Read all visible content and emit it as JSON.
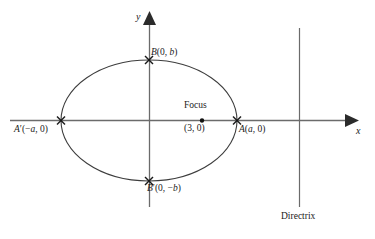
{
  "figure": {
    "background_color": "#ffffff",
    "line_color": "#6b6b6b",
    "text_color": "#1a1a1a",
    "axes": {
      "x_axis_label": "x",
      "y_axis_label": "y",
      "origin_label": ""
    },
    "labels": {
      "vertex_b": "B(0, b)",
      "vertex_b_prime": "B′(0, −b)",
      "vertex_a": "A(a, 0)",
      "vertex_a_prime": "A′(−a, 0)",
      "focus_title": "Focus",
      "focus_coordinates": "(3, 0)",
      "directrix": "Directrix"
    }
  },
  "chart_data": {
    "type": "scatter",
    "xlabel": "x",
    "ylabel": "y",
    "grid": false,
    "legend": null,
    "curves": [
      {
        "name": "ellipse",
        "shape": "ellipse",
        "center": [
          0,
          0
        ],
        "semi_major_axis_label": "a",
        "semi_minor_axis_label": "b",
        "center_px": [
          149,
          120
        ],
        "radius_x_px": 88,
        "radius_y_px": 60
      },
      {
        "name": "directrix",
        "shape": "vertical-line",
        "x_px": 299,
        "y_start_px": 28,
        "y_end_px": 207
      }
    ],
    "points": [
      {
        "name": "A",
        "label": "A(a, 0)",
        "marker": "x",
        "coords": [
          "a",
          0
        ],
        "px": [
          237,
          120
        ]
      },
      {
        "name": "A'",
        "label": "A′(−a, 0)",
        "marker": "x",
        "coords": [
          "-a",
          0
        ],
        "px": [
          61,
          120
        ]
      },
      {
        "name": "B",
        "label": "B(0, b)",
        "marker": "x",
        "coords": [
          0,
          "b"
        ],
        "px": [
          149,
          60
        ]
      },
      {
        "name": "B'",
        "label": "B′(0, −b)",
        "marker": "x",
        "coords": [
          0,
          "-b"
        ],
        "px": [
          149,
          181
        ]
      },
      {
        "name": "Focus",
        "label": "(3, 0)",
        "marker": "dot",
        "coords": [
          3,
          0
        ],
        "px": [
          202,
          120
        ]
      }
    ],
    "annotations": [
      {
        "text": "Focus",
        "px": [
          202,
          106
        ]
      },
      {
        "text": "Directrix",
        "px": [
          299,
          217
        ]
      }
    ]
  }
}
